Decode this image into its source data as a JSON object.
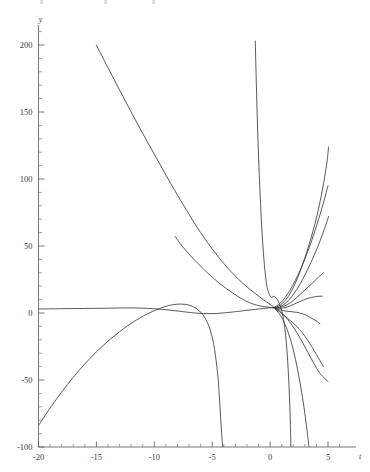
{
  "chart_data": {
    "type": "line",
    "title": "",
    "subtitle": "",
    "xlabel": "t",
    "ylabel": "y",
    "grid": false,
    "legend": "none",
    "xlim": [
      -20.6,
      6.6
    ],
    "ylim": [
      -108,
      218
    ],
    "x_ticks": [
      -20,
      -15,
      -10,
      -5,
      0,
      5
    ],
    "x_tick_labels": [
      "-20",
      "-15",
      "-10",
      "-5",
      "0",
      "5"
    ],
    "x_minor_step": 1,
    "y_ticks": [
      -100,
      -50,
      0,
      50,
      100,
      150,
      200
    ],
    "y_tick_labels": [
      "-100",
      "-50",
      "0",
      "50",
      "100",
      "150",
      "200"
    ],
    "y_minor_step": 10,
    "axis_color": "#555555",
    "curve_color": "#3c3c3c",
    "background": "#ffffff",
    "pencil_point": [
      0.3,
      4
    ],
    "series": [
      {
        "name": "curve-1",
        "comment": "long descending branch from (-15,200) through pencil region, continues to lower right",
        "points": [
          [
            -15.0,
            200.0
          ],
          [
            -14.0,
            183.0
          ],
          [
            -13.0,
            166.5
          ],
          [
            -12.0,
            150.0
          ],
          [
            -11.0,
            134.0
          ],
          [
            -10.0,
            118.5
          ],
          [
            -9.0,
            103.0
          ],
          [
            -8.0,
            88.0
          ],
          [
            -7.2,
            76.5
          ],
          [
            -6.6,
            68.0
          ],
          [
            -6.0,
            60.0
          ],
          [
            -5.4,
            52.5
          ],
          [
            -4.8,
            45.5
          ],
          [
            -4.2,
            39.0
          ],
          [
            -3.6,
            33.0
          ],
          [
            -3.0,
            27.5
          ],
          [
            -2.4,
            22.5
          ],
          [
            -1.8,
            18.0
          ],
          [
            -1.2,
            14.0
          ],
          [
            -0.6,
            10.0
          ],
          [
            0.0,
            6.5
          ],
          [
            0.3,
            4.5
          ],
          [
            0.8,
            1.5
          ],
          [
            1.3,
            -2.5
          ],
          [
            1.8,
            -8.0
          ],
          [
            2.3,
            -14.5
          ],
          [
            2.8,
            -22.0
          ],
          [
            3.3,
            -30.0
          ],
          [
            3.8,
            -38.0
          ],
          [
            4.3,
            -45.0
          ],
          [
            4.8,
            -49.5
          ],
          [
            5.0,
            -51.0
          ]
        ]
      },
      {
        "name": "curve-2",
        "comment": "descends from upper-left, bottoms out near t=-1 then rises; plunges to -100 at t=-4.1",
        "points": [
          [
            -4.1,
            -100.0
          ],
          [
            -4.2,
            -88.0
          ],
          [
            -4.3,
            -74.0
          ],
          [
            -4.4,
            -60.0
          ],
          [
            -4.5,
            -48.0
          ],
          [
            -4.7,
            -33.0
          ],
          [
            -4.9,
            -22.0
          ],
          [
            -5.2,
            -12.0
          ],
          [
            -5.6,
            -4.0
          ],
          [
            -6.1,
            1.5
          ],
          [
            -6.7,
            5.0
          ],
          [
            -7.4,
            6.5
          ],
          [
            -8.1,
            6.5
          ],
          [
            -8.8,
            5.5
          ],
          [
            -9.5,
            3.5
          ],
          [
            -10.2,
            1.0
          ],
          [
            -10.9,
            -2.0
          ],
          [
            -11.6,
            -5.5
          ],
          [
            -12.3,
            -9.5
          ],
          [
            -13.0,
            -14.0
          ],
          [
            -14.0,
            -21.0
          ],
          [
            -15.0,
            -29.0
          ],
          [
            -16.0,
            -38.0
          ],
          [
            -17.0,
            -48.0
          ],
          [
            -18.0,
            -59.0
          ],
          [
            -19.0,
            -71.0
          ],
          [
            -20.0,
            -84.0
          ]
        ]
      },
      {
        "name": "curve-3",
        "comment": "steep branch rising from pencil region to y=200 near t=-1.2",
        "points": [
          [
            1.8,
            -100.0
          ],
          [
            1.75,
            -84.0
          ],
          [
            1.7,
            -68.0
          ],
          [
            1.62,
            -52.0
          ],
          [
            1.52,
            -36.0
          ],
          [
            1.4,
            -22.0
          ],
          [
            1.25,
            -10.0
          ],
          [
            1.05,
            0.0
          ],
          [
            0.8,
            7.0
          ],
          [
            0.55,
            11.0
          ],
          [
            0.3,
            12.5
          ],
          [
            0.05,
            12.0
          ],
          [
            -0.25,
            19.0
          ],
          [
            -0.45,
            32.0
          ],
          [
            -0.62,
            50.0
          ],
          [
            -0.76,
            70.0
          ],
          [
            -0.88,
            92.0
          ],
          [
            -0.99,
            115.0
          ],
          [
            -1.08,
            138.0
          ],
          [
            -1.16,
            162.0
          ],
          [
            -1.23,
            185.0
          ],
          [
            -1.28,
            203.0
          ]
        ]
      },
      {
        "name": "curve-4",
        "comment": "parabola-like branch through pencil, rising to y=125 at t=5",
        "points": [
          [
            -8.2,
            57.0
          ],
          [
            -7.6,
            50.0
          ],
          [
            -7.0,
            44.0
          ],
          [
            -6.3,
            37.5
          ],
          [
            -5.6,
            31.5
          ],
          [
            -4.9,
            26.0
          ],
          [
            -4.2,
            21.0
          ],
          [
            -3.5,
            16.5
          ],
          [
            -2.8,
            12.5
          ],
          [
            -2.1,
            9.0
          ],
          [
            -1.4,
            6.5
          ],
          [
            -0.7,
            5.0
          ],
          [
            0.0,
            4.2
          ],
          [
            0.3,
            4.0
          ],
          [
            0.9,
            6.0
          ],
          [
            1.5,
            11.5
          ],
          [
            2.0,
            19.0
          ],
          [
            2.5,
            29.0
          ],
          [
            3.0,
            41.0
          ],
          [
            3.5,
            55.0
          ],
          [
            4.0,
            71.0
          ],
          [
            4.5,
            91.0
          ],
          [
            4.9,
            112.0
          ],
          [
            5.05,
            124.0
          ]
        ]
      },
      {
        "name": "curve-5",
        "comment": "fan member rising to y=72 at t=5",
        "points": [
          [
            0.3,
            4.0
          ],
          [
            0.8,
            4.5
          ],
          [
            1.3,
            7.0
          ],
          [
            1.8,
            11.5
          ],
          [
            2.3,
            17.5
          ],
          [
            2.8,
            25.0
          ],
          [
            3.3,
            33.5
          ],
          [
            3.8,
            43.0
          ],
          [
            4.3,
            53.5
          ],
          [
            4.7,
            63.0
          ],
          [
            5.05,
            72.0
          ]
        ]
      },
      {
        "name": "curve-6",
        "comment": "fan member rising to about y=30 at t=4.6",
        "points": [
          [
            0.3,
            4.0
          ],
          [
            0.8,
            4.0
          ],
          [
            1.3,
            5.5
          ],
          [
            1.8,
            8.0
          ],
          [
            2.3,
            11.5
          ],
          [
            2.8,
            15.5
          ],
          [
            3.3,
            19.5
          ],
          [
            3.8,
            23.5
          ],
          [
            4.2,
            27.0
          ],
          [
            4.6,
            30.0
          ]
        ]
      },
      {
        "name": "curve-7",
        "comment": "fan member flattening near y=12 at t=4.5",
        "points": [
          [
            0.3,
            4.0
          ],
          [
            0.8,
            3.5
          ],
          [
            1.3,
            4.0
          ],
          [
            1.8,
            5.5
          ],
          [
            2.3,
            7.5
          ],
          [
            2.8,
            9.5
          ],
          [
            3.3,
            11.0
          ],
          [
            3.8,
            12.0
          ],
          [
            4.2,
            12.5
          ],
          [
            4.5,
            12.5
          ]
        ]
      },
      {
        "name": "curve-8",
        "comment": "fan member turning over, descending toward y=-8 at t=4.3",
        "points": [
          [
            0.3,
            4.0
          ],
          [
            0.8,
            2.5
          ],
          [
            1.3,
            1.5
          ],
          [
            1.8,
            1.0
          ],
          [
            2.3,
            0.5
          ],
          [
            2.8,
            -0.5
          ],
          [
            3.2,
            -2.0
          ],
          [
            3.6,
            -4.0
          ],
          [
            4.0,
            -6.0
          ],
          [
            4.3,
            -8.0
          ]
        ]
      },
      {
        "name": "curve-9",
        "comment": "fan member descending to y=-40 at t=4.6",
        "points": [
          [
            0.3,
            4.0
          ],
          [
            0.8,
            1.0
          ],
          [
            1.3,
            -2.5
          ],
          [
            1.8,
            -6.0
          ],
          [
            2.3,
            -10.0
          ],
          [
            2.8,
            -15.0
          ],
          [
            3.3,
            -21.0
          ],
          [
            3.8,
            -28.0
          ],
          [
            4.2,
            -34.0
          ],
          [
            4.6,
            -40.0
          ]
        ]
      },
      {
        "name": "curve-10",
        "comment": "steep fan member diving below -100 past t=2.4, reaching bottom edge",
        "points": [
          [
            0.3,
            4.0
          ],
          [
            0.7,
            0.5
          ],
          [
            1.1,
            -5.0
          ],
          [
            1.5,
            -13.0
          ],
          [
            1.9,
            -24.0
          ],
          [
            2.2,
            -35.0
          ],
          [
            2.5,
            -48.0
          ],
          [
            2.8,
            -63.0
          ],
          [
            3.05,
            -78.0
          ],
          [
            3.25,
            -92.0
          ],
          [
            3.4,
            -104.0
          ]
        ]
      },
      {
        "name": "curve-11",
        "comment": "left-branch approach line entering the pencil from upper-left at low slope",
        "points": [
          [
            -20.0,
            3.0
          ],
          [
            -18.0,
            3.2
          ],
          [
            -16.0,
            3.4
          ],
          [
            -14.0,
            3.6
          ],
          [
            -12.0,
            3.8
          ],
          [
            -10.0,
            3.2
          ],
          [
            -8.0,
            1.5
          ],
          [
            -6.5,
            0.0
          ],
          [
            -5.0,
            -0.5
          ],
          [
            -3.5,
            0.5
          ],
          [
            -2.5,
            1.5
          ],
          [
            -1.5,
            2.5
          ],
          [
            -0.6,
            3.4
          ],
          [
            0.0,
            3.9
          ],
          [
            0.3,
            4.0
          ]
        ]
      },
      {
        "name": "curve-12",
        "comment": "near-tangent upper fan member rising to y=95 at right edge",
        "points": [
          [
            0.3,
            4.0
          ],
          [
            0.9,
            7.5
          ],
          [
            1.5,
            14.0
          ],
          [
            2.1,
            23.0
          ],
          [
            2.7,
            34.0
          ],
          [
            3.3,
            47.0
          ],
          [
            3.9,
            62.0
          ],
          [
            4.5,
            79.0
          ],
          [
            5.0,
            95.0
          ]
        ]
      }
    ]
  },
  "axis_labels": {
    "x_axis_name": "t",
    "y_axis_name": "y"
  }
}
